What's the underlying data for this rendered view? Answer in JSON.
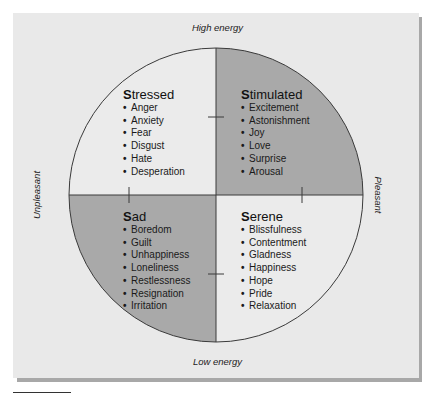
{
  "figure": {
    "axes": {
      "top": "High energy",
      "bottom": "Low energy",
      "left": "Unpleasant",
      "right": "Pleasant"
    },
    "colors": {
      "panel_background": "#e9e9e9",
      "light_quadrant": "#ebebeb",
      "dark_quadrant": "#a9a9a9",
      "line": "#3a3a3a",
      "shadow": "#a8a8a8"
    },
    "quadrants": [
      {
        "id": "stressed",
        "initial": "S",
        "rest": "tressed",
        "shade": "light",
        "items": [
          "Anger",
          "Anxiety",
          "Fear",
          "Disgust",
          "Hate",
          "Desperation"
        ]
      },
      {
        "id": "stimulated",
        "initial": "S",
        "rest": "timulated",
        "shade": "dark",
        "items": [
          "Excitement",
          "Astonishment",
          "Joy",
          "Love",
          "Surprise",
          "Arousal"
        ]
      },
      {
        "id": "sad",
        "initial": "S",
        "rest": "ad",
        "shade": "dark",
        "items": [
          "Boredom",
          "Guilt",
          "Unhappiness",
          "Loneliness",
          "Restlessness",
          "Resignation",
          "Irritation"
        ]
      },
      {
        "id": "serene",
        "initial": "S",
        "rest": "erene",
        "shade": "light",
        "items": [
          "Blissfulness",
          "Contentment",
          "Gladness",
          "Happiness",
          "Hope",
          "Pride",
          "Relaxation"
        ]
      }
    ],
    "bullet": "•"
  }
}
